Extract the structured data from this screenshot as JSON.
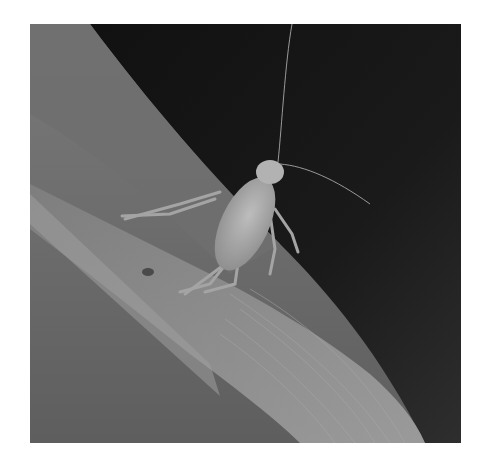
{
  "image": {
    "alt": "Grayscale photograph of a bush-cricket nymph perched on a grass blade against a dark background",
    "subject": "cricket nymph",
    "colors": {
      "background": "#ffffff",
      "dark_bg": "#1c1c1c",
      "blade": "#8a8a8a",
      "insect": "#a8a8a8"
    }
  }
}
